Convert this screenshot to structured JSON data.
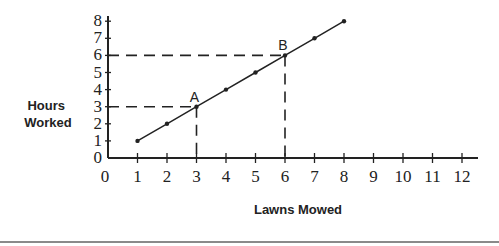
{
  "chart_data": {
    "type": "line",
    "title": "",
    "xlabel": "Lawns Mowed",
    "ylabel_lines": [
      "Hours",
      "Worked"
    ],
    "ylabel": "Hours Worked",
    "x_ticks": [
      0,
      1,
      2,
      3,
      4,
      5,
      6,
      7,
      8,
      9,
      10,
      11,
      12
    ],
    "y_ticks": [
      0,
      1,
      2,
      3,
      4,
      5,
      6,
      7,
      8
    ],
    "xlim": [
      0,
      12
    ],
    "ylim": [
      0,
      8
    ],
    "grid": false,
    "legend": null,
    "series": [
      {
        "name": "Hours Worked vs Lawns Mowed",
        "x": [
          1,
          2,
          3,
          4,
          5,
          6,
          7,
          8
        ],
        "y": [
          1,
          2,
          3,
          4,
          5,
          6,
          7,
          8
        ]
      }
    ],
    "annotations": [
      {
        "label": "A",
        "x": 3,
        "y": 3,
        "dashed_guides": true
      },
      {
        "label": "B",
        "x": 6,
        "y": 6,
        "dashed_guides": true
      }
    ]
  },
  "colors": {
    "ink": "#222222",
    "separator": "#8a8a8a"
  }
}
